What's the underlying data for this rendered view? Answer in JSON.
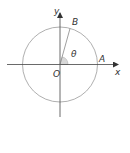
{
  "diagram": {
    "type": "unit-circle-angle",
    "labels": {
      "y_axis": "y",
      "x_axis": "x",
      "origin": "O",
      "point_a": "A",
      "point_b": "B",
      "angle": "θ"
    },
    "colors": {
      "axis": "#444444",
      "circle": "#9a9a9a",
      "radius": "#888888",
      "angle_fill": "#d8d8d8",
      "text": "#333333"
    }
  }
}
